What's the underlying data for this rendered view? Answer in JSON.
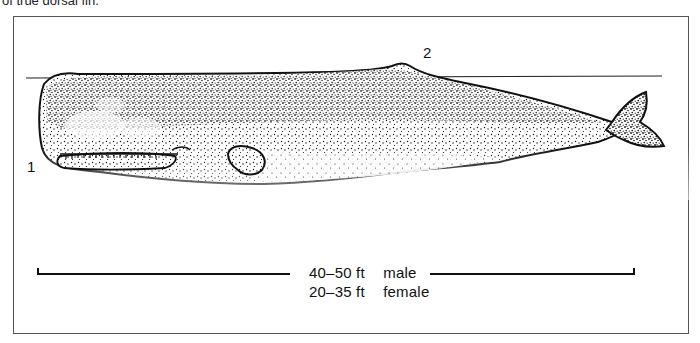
{
  "caption": {
    "text": "of true dorsal fin."
  },
  "diagram": {
    "callouts": [
      {
        "id": "1",
        "label": "1",
        "points_to": "head / lower jaw"
      },
      {
        "id": "2",
        "label": "2",
        "points_to": "dorsal hump"
      }
    ],
    "length_scale": {
      "male": {
        "range": "40–50 ft",
        "sex": "male"
      },
      "female": {
        "range": "20–35 ft",
        "sex": "female"
      }
    }
  },
  "colors": {
    "ink": "#1a1a1a",
    "paper": "#ffffff",
    "frame": "#555555"
  }
}
